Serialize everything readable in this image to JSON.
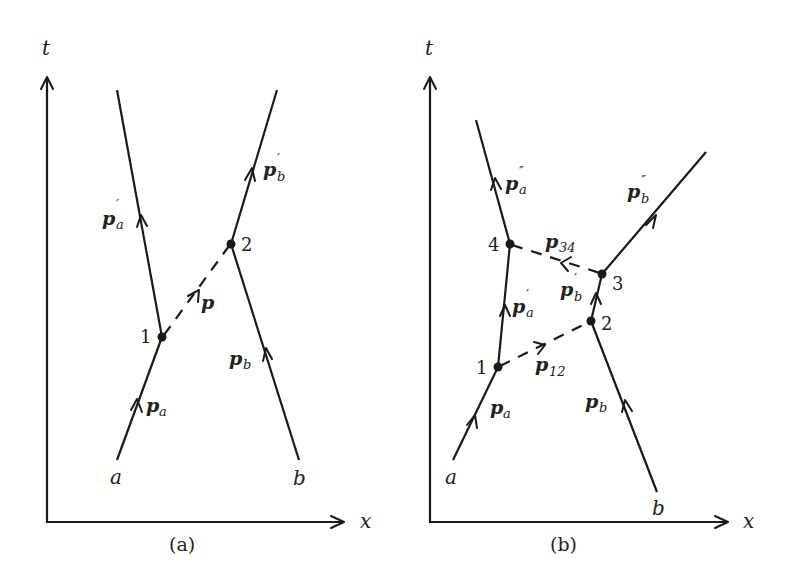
{
  "figure": {
    "panels": [
      {
        "id": "a",
        "caption": "(a)",
        "axes": {
          "x_label": "x",
          "t_label": "t"
        },
        "vertices": [
          {
            "label": "1"
          },
          {
            "label": "2"
          }
        ],
        "endpoints": {
          "a": "a",
          "b": "b"
        },
        "momenta": {
          "pa": {
            "base": "p",
            "sub": "a",
            "prime": ""
          },
          "pa1": {
            "base": "p",
            "sub": "a",
            "prime": "′"
          },
          "pb": {
            "base": "p",
            "sub": "b",
            "prime": ""
          },
          "pb1": {
            "base": "p",
            "sub": "b",
            "prime": "′"
          },
          "p": {
            "base": "p",
            "sub": "",
            "prime": ""
          }
        }
      },
      {
        "id": "b",
        "caption": "(b)",
        "axes": {
          "x_label": "x",
          "t_label": "t"
        },
        "vertices": [
          {
            "label": "1"
          },
          {
            "label": "2"
          },
          {
            "label": "3"
          },
          {
            "label": "4"
          }
        ],
        "endpoints": {
          "a": "a",
          "b": "b"
        },
        "momenta": {
          "pa": {
            "base": "p",
            "sub": "a",
            "prime": ""
          },
          "pa1": {
            "base": "p",
            "sub": "a",
            "prime": "′"
          },
          "pa2": {
            "base": "p",
            "sub": "a",
            "prime": "″"
          },
          "pb": {
            "base": "p",
            "sub": "b",
            "prime": ""
          },
          "pb1": {
            "base": "p",
            "sub": "b",
            "prime": "′"
          },
          "pb2": {
            "base": "p",
            "sub": "b",
            "prime": "″"
          },
          "p12": {
            "base": "p",
            "sub": "12",
            "prime": ""
          },
          "p34": {
            "base": "p",
            "sub": "34",
            "prime": ""
          }
        }
      }
    ]
  }
}
